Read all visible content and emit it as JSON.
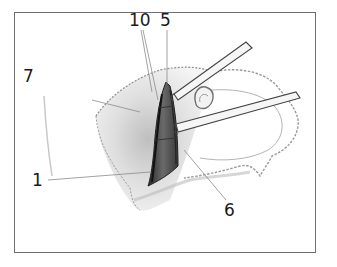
{
  "figure": {
    "type": "surgical-illustration",
    "frame_color": "#6e6e6e",
    "ink_color": "#1a1a1a",
    "labels": [
      {
        "id": "10",
        "text": "10",
        "x": 129,
        "y": 12
      },
      {
        "id": "5",
        "text": "5",
        "x": 160,
        "y": 12
      },
      {
        "id": "7",
        "text": "7",
        "x": 23,
        "y": 68
      },
      {
        "id": "1",
        "text": "1",
        "x": 32,
        "y": 172
      },
      {
        "id": "6",
        "text": "6",
        "x": 224,
        "y": 202
      }
    ],
    "elements": [
      "skin-flap",
      "incision",
      "retractor-upper",
      "retractor-lower",
      "ear-lobe-outline",
      "leader-lines"
    ]
  }
}
